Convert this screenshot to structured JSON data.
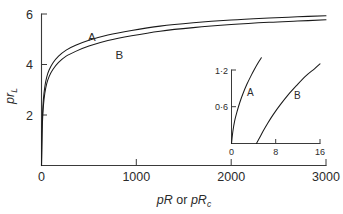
{
  "chart_data": {
    "type": "line",
    "title": "",
    "xlabel": "pR or pRc",
    "xlabel_main": "pR",
    "xlabel_conj": " or ",
    "xlabel_second": "pR",
    "xlabel_second_sub": "c",
    "ylabel_main": "pr",
    "ylabel_sub": "L",
    "xlim": [
      0,
      3000
    ],
    "ylim": [
      0,
      6
    ],
    "xticks": [
      0,
      1000,
      2000,
      3000
    ],
    "xticklabels": [
      "0",
      "1000",
      "2000",
      "3000"
    ],
    "yticks": [
      2,
      4,
      6
    ],
    "yticklabels": [
      "2",
      "4",
      "6"
    ],
    "grid": false,
    "legend_position": "inline-annotations",
    "annotations": [
      {
        "text": "A",
        "x": 530,
        "y": 4.95
      },
      {
        "text": "B",
        "x": 820,
        "y": 4.22
      }
    ],
    "series": [
      {
        "name": "A",
        "x": [
          0,
          5,
          10,
          20,
          35,
          55,
          80,
          120,
          180,
          260,
          360,
          500,
          700,
          950,
          1250,
          1600,
          2000,
          2400,
          2700,
          3000
        ],
        "values": [
          0,
          1.3,
          1.95,
          2.62,
          3.12,
          3.5,
          3.78,
          4.06,
          4.33,
          4.57,
          4.76,
          4.96,
          5.17,
          5.35,
          5.52,
          5.65,
          5.76,
          5.84,
          5.89,
          5.93
        ]
      },
      {
        "name": "B",
        "x": [
          0,
          5,
          10,
          20,
          35,
          55,
          80,
          120,
          180,
          260,
          360,
          500,
          700,
          950,
          1250,
          1600,
          2000,
          2400,
          2700,
          3000
        ],
        "values": [
          0,
          1.1,
          1.72,
          2.36,
          2.86,
          3.24,
          3.52,
          3.8,
          4.08,
          4.33,
          4.52,
          4.73,
          4.95,
          5.14,
          5.32,
          5.46,
          5.58,
          5.67,
          5.72,
          5.77
        ]
      }
    ],
    "inset": {
      "type": "line",
      "xlim": [
        0,
        16
      ],
      "ylim": [
        0,
        1.2
      ],
      "xticks": [
        0,
        8,
        16
      ],
      "xticklabels": [
        "0",
        "8",
        "16"
      ],
      "yticks": [
        0.6,
        1.2
      ],
      "yticklabels": [
        "0·6",
        "1·2"
      ],
      "grid": false,
      "annotations": [
        {
          "text": "A",
          "x": 3.4,
          "y": 0.77
        },
        {
          "text": "B",
          "x": 11.9,
          "y": 0.72
        }
      ],
      "series": [
        {
          "name": "A",
          "x": [
            0,
            0.25,
            0.6,
            1.0,
            1.5,
            2.1,
            2.8,
            3.5,
            4.2,
            4.9,
            5.4
          ],
          "values": [
            0,
            0.2,
            0.38,
            0.52,
            0.67,
            0.82,
            0.97,
            1.1,
            1.22,
            1.33,
            1.4
          ]
        },
        {
          "name": "B",
          "x": [
            4.5,
            5.0,
            5.7,
            6.6,
            7.6,
            8.8,
            10.2,
            11.8,
            13.4,
            15.0,
            16.0
          ],
          "values": [
            0,
            0.08,
            0.2,
            0.34,
            0.48,
            0.63,
            0.79,
            0.95,
            1.1,
            1.22,
            1.3
          ]
        }
      ]
    }
  }
}
